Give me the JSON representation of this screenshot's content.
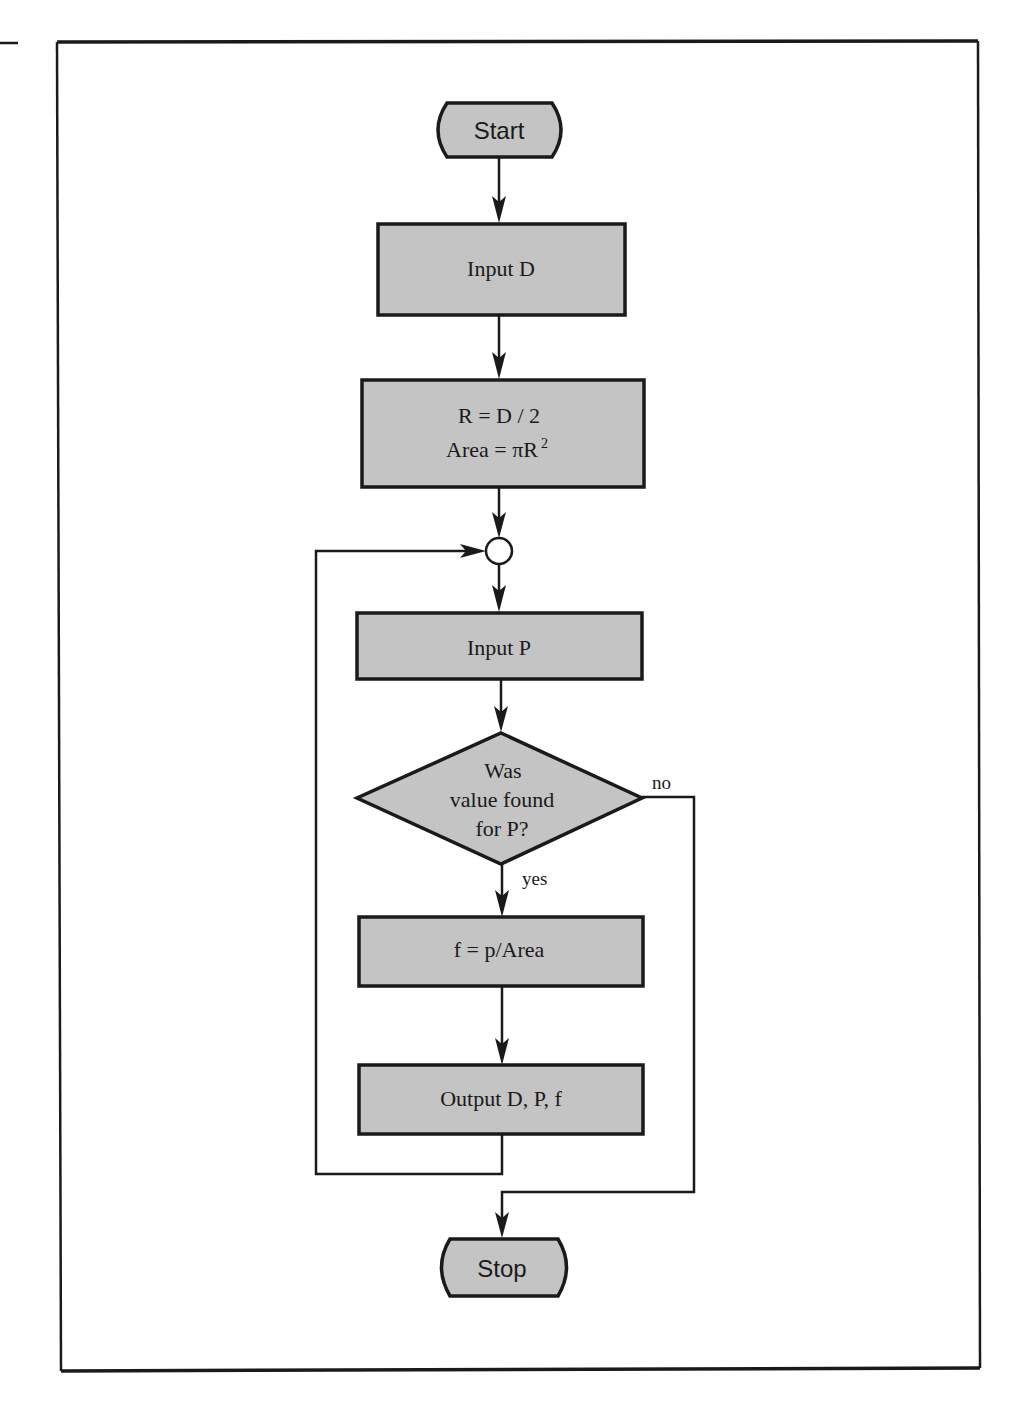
{
  "diagram": {
    "type": "flowchart",
    "colors": {
      "fill": "#c4c4c4",
      "stroke": "#1a1a1a",
      "background": "#ffffff"
    },
    "nodes": {
      "start": {
        "shape": "terminal",
        "label": "Start"
      },
      "input_d": {
        "shape": "process",
        "label": "Input D"
      },
      "compute": {
        "shape": "process",
        "line1": "R = D / 2",
        "line2_prefix": "Area = πR",
        "line2_sup": "2"
      },
      "connector": {
        "shape": "connector",
        "label": ""
      },
      "input_p": {
        "shape": "process",
        "label": "Input P"
      },
      "decision": {
        "shape": "decision",
        "line1": "Was",
        "line2": "value found",
        "line3": "for P?"
      },
      "compute_f": {
        "shape": "process",
        "label": "f = p/Area"
      },
      "output": {
        "shape": "process",
        "label": "Output D, P, f"
      },
      "stop": {
        "shape": "terminal",
        "label": "Stop"
      }
    },
    "edges": {
      "yes_label": "yes",
      "no_label": "no"
    }
  }
}
